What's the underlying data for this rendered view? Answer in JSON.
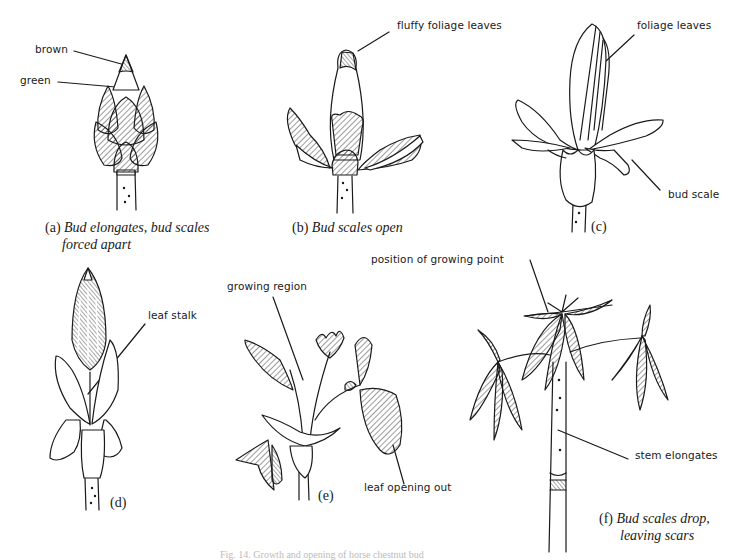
{
  "figure": {
    "caption": "Fig. 14. Growth and opening of horse chestnut bud",
    "panels": [
      {
        "id": "a",
        "letter": "(a)",
        "caption_line1": "Bud elongates, bud scales",
        "caption_line2": "forced apart",
        "labels": [
          "brown",
          "green"
        ]
      },
      {
        "id": "b",
        "letter": "(b)",
        "caption_line1": "Bud scales open",
        "labels": [
          "fluffy foliage leaves"
        ]
      },
      {
        "id": "c",
        "letter": "(c)",
        "labels": [
          "foliage leaves",
          "bud scale"
        ]
      },
      {
        "id": "d",
        "letter": "(d)",
        "labels": [
          "leaf stalk"
        ]
      },
      {
        "id": "e",
        "letter": "(e)",
        "labels": [
          "growing region",
          "leaf opening out"
        ]
      },
      {
        "id": "f",
        "letter": "(f)",
        "caption_line1": "Bud scales drop,",
        "caption_line2": "leaving scars",
        "labels": [
          "position of growing point",
          "stem elongates"
        ]
      }
    ]
  }
}
